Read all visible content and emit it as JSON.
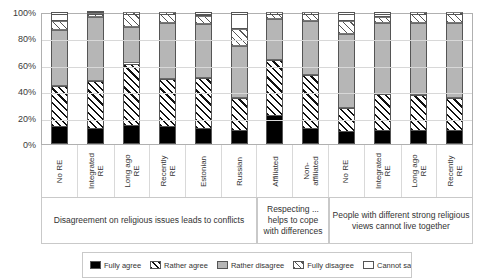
{
  "chart_data": {
    "type": "bar",
    "subtype": "stacked-percent",
    "title": "",
    "xlabel": "",
    "ylabel": "",
    "ylim": [
      0,
      100
    ],
    "yticks": [
      "0%",
      "20%",
      "40%",
      "60%",
      "80%",
      "100%"
    ],
    "ytick_values": [
      0,
      20,
      40,
      60,
      80,
      100
    ],
    "grid": true,
    "legend_position": "bottom",
    "categories": [
      "No RE",
      "Integrated RE",
      "Long ago RE",
      "Recently RE",
      "Estonian",
      "Russian",
      "Affiliated",
      "Non-affiliated",
      "No RE",
      "Integrated RE",
      "Long ago RE",
      "Recently RE"
    ],
    "category_lines": [
      [
        "No RE"
      ],
      [
        "Integrated",
        "RE"
      ],
      [
        "Long ago",
        "RE"
      ],
      [
        "Recently",
        "RE"
      ],
      [
        "Estonian"
      ],
      [
        "Russian"
      ],
      [
        "Affiliated"
      ],
      [
        "Non-",
        "affiliated"
      ],
      [
        "No RE"
      ],
      [
        "Integrated",
        "RE"
      ],
      [
        "Long ago",
        "RE"
      ],
      [
        "Recently",
        "RE"
      ]
    ],
    "groups": [
      {
        "label": "Disagreement on religious issues leads to conflicts",
        "span": 6
      },
      {
        "label": "Respecting ... helps to cope with differences",
        "span": 2
      },
      {
        "label": "People with different strong religious views cannot live together",
        "span": 4
      }
    ],
    "series": [
      {
        "name": "Fully agree",
        "fill": "black",
        "values": [
          13,
          11,
          14,
          13,
          11,
          10,
          21,
          11,
          9,
          10,
          10,
          10
        ]
      },
      {
        "name": "Rather agree",
        "fill": "hatch",
        "values": [
          31,
          37,
          47,
          36,
          39,
          25,
          43,
          41,
          18,
          28,
          27,
          25
        ]
      },
      {
        "name": "Rather disagree",
        "fill": "gray",
        "values": [
          42,
          48,
          28,
          43,
          41,
          39,
          31,
          41,
          56,
          54,
          55,
          57
        ]
      },
      {
        "name": "Fully disagree",
        "fill": "hatch-light",
        "values": [
          7,
          3,
          11,
          8,
          6,
          13,
          5,
          7,
          10,
          4,
          8,
          8
        ]
      },
      {
        "name": "Cannot say",
        "fill": "white",
        "values": [
          7,
          1,
          0,
          0,
          3,
          13,
          0,
          0,
          7,
          4,
          0,
          0
        ]
      }
    ]
  },
  "legend": {
    "items": [
      {
        "label": "Fully agree",
        "fill": "black"
      },
      {
        "label": "Rather agree",
        "fill": "hatch"
      },
      {
        "label": "Rather disagree",
        "fill": "gray"
      },
      {
        "label": "Fully disagree",
        "fill": "hatch-light"
      },
      {
        "label": "Cannot say",
        "fill": "white"
      }
    ]
  },
  "colors": {
    "black": "#000000",
    "gray": "#b6b6b6",
    "white": "#ffffff",
    "hatch_line": "#111111",
    "grid": "#d8d8d8",
    "axis": "#b0b0b0",
    "text": "#333333"
  }
}
